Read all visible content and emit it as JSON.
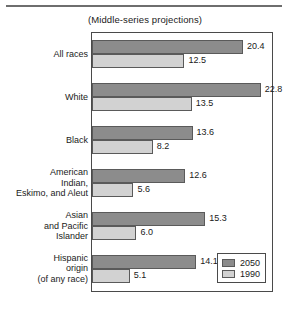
{
  "chart_data": {
    "type": "bar",
    "orientation": "horizontal",
    "title": "(Middle-series projections)",
    "xlabel": "",
    "ylabel": "",
    "xlim": [
      0,
      24.2
    ],
    "grid": false,
    "legend_position": "bottom-right-inside",
    "categories": [
      "All races",
      "White",
      "Black",
      "American Indian, Eskimo, and Aleut",
      "Asian and Pacific Islander",
      "Hispanic origin (of any race)"
    ],
    "category_label_lines": [
      [
        "All races"
      ],
      [
        "White"
      ],
      [
        "Black"
      ],
      [
        "American",
        "Indian,",
        "Eskimo, and Aleut"
      ],
      [
        "Asian",
        "and Pacific",
        "Islander"
      ],
      [
        "Hispanic",
        "origin",
        "(of any race)"
      ]
    ],
    "series": [
      {
        "name": "2050",
        "color": "#8c8c8c",
        "values": [
          20.4,
          22.8,
          13.6,
          12.6,
          15.3,
          14.1
        ],
        "labels": [
          "20.4",
          "22.8",
          "13.6",
          "12.6",
          "15.3",
          "14.1"
        ]
      },
      {
        "name": "1990",
        "color": "#d2d2d2",
        "values": [
          12.5,
          13.5,
          8.2,
          5.6,
          6.0,
          5.1
        ],
        "labels": [
          "12.5",
          "13.5",
          "8.2",
          "5.6",
          "6.0",
          "5.1"
        ]
      }
    ],
    "legend": [
      {
        "label": "2050",
        "color": "#8c8c8c"
      },
      {
        "label": "1990",
        "color": "#d2d2d2"
      }
    ]
  }
}
